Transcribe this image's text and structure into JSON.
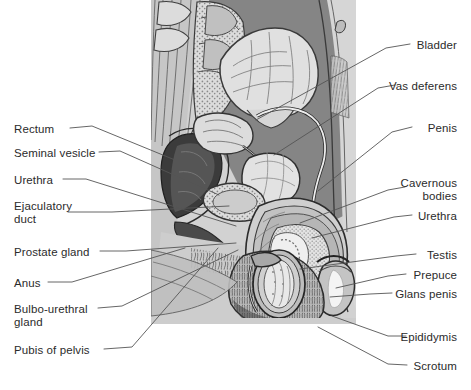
{
  "figure": {
    "background_color": "#ffffff",
    "text_color": "#2b2b2b",
    "leader_line_color": "#555555",
    "illustration": {
      "style": "grayscale medical line illustration",
      "palette": {
        "page": "#ffffff",
        "tissue_light": "#d8d8d8",
        "tissue_mid": "#bdbdbd",
        "tissue_dark": "#8f8f8f",
        "cavity_dark": "#7d7d7d",
        "organ_highlight": "#e8e8e8",
        "outline": "#3a3a3a",
        "deep_shadow": "#2e2e2e"
      }
    }
  },
  "labels": {
    "left": [
      {
        "id": "rectum",
        "text": "Rectum",
        "x": 14,
        "y": 123
      },
      {
        "id": "seminal-vesicle",
        "text": "Seminal vesicle",
        "x": 14,
        "y": 147
      },
      {
        "id": "urethra-left",
        "text": "Urethra",
        "x": 14,
        "y": 174
      },
      {
        "id": "ejaculatory-duct",
        "text": "Ejaculatory\nduct",
        "x": 14,
        "y": 200
      },
      {
        "id": "prostate-gland",
        "text": "Prostate gland",
        "x": 14,
        "y": 246
      },
      {
        "id": "anus",
        "text": "Anus",
        "x": 14,
        "y": 277
      },
      {
        "id": "bulbo-urethral",
        "text": "Bulbo-urethral\ngland",
        "x": 14,
        "y": 303
      },
      {
        "id": "pubis-of-pelvis",
        "text": "Pubis of pelvis",
        "x": 14,
        "y": 344
      }
    ],
    "right": [
      {
        "id": "bladder",
        "text": "Bladder",
        "x": 457,
        "y": 39
      },
      {
        "id": "vas-deferens",
        "text": "Vas deferens",
        "x": 457,
        "y": 80
      },
      {
        "id": "penis",
        "text": "Penis",
        "x": 457,
        "y": 122
      },
      {
        "id": "cavernous-bodies",
        "text": "Cavernous\nbodies",
        "x": 457,
        "y": 177
      },
      {
        "id": "urethra-right",
        "text": "Urethra",
        "x": 457,
        "y": 210
      },
      {
        "id": "testis",
        "text": "Testis",
        "x": 457,
        "y": 249
      },
      {
        "id": "prepuce",
        "text": "Prepuce",
        "x": 457,
        "y": 269
      },
      {
        "id": "glans-penis",
        "text": "Glans penis",
        "x": 457,
        "y": 288
      },
      {
        "id": "epididymis",
        "text": "Epididymis",
        "x": 457,
        "y": 331
      },
      {
        "id": "scrotum",
        "text": "Scrotum",
        "x": 457,
        "y": 360
      }
    ]
  },
  "leader_lines": [
    {
      "id": "leader-rectum",
      "points": "70,128 92,126 175,160"
    },
    {
      "id": "leader-seminal-vesicle",
      "points": "99,152 120,151 219,195"
    },
    {
      "id": "leader-urethra-left",
      "points": "63,179 86,179 236,226"
    },
    {
      "id": "leader-ejaculatory-duct",
      "points": "68,212 112,212 229,206"
    },
    {
      "id": "leader-prostate-gland",
      "points": "100,251 126,251 236,243"
    },
    {
      "id": "leader-anus",
      "points": "48,282 72,282 185,248"
    },
    {
      "id": "leader-bulbo-urethral",
      "points": "98,308 122,306 238,250"
    },
    {
      "id": "leader-pubis-of-pelvis",
      "points": "104,349 132,347 218,248"
    },
    {
      "id": "leader-bladder",
      "points": "410,44 386,48 256,120"
    },
    {
      "id": "leader-vas-deferens",
      "points": "395,85 378,88 274,155"
    },
    {
      "id": "leader-penis",
      "points": "412,127 392,132 318,191"
    },
    {
      "id": "leader-cavernous-bodies",
      "points": "405,187 388,190 300,223"
    },
    {
      "id": "leader-urethra-right",
      "points": "412,215 394,217 312,238"
    },
    {
      "id": "leader-testis",
      "points": "416,254 396,256 300,269"
    },
    {
      "id": "leader-prepuce",
      "points": "406,274 388,276 336,288"
    },
    {
      "id": "leader-glans-penis",
      "points": "392,293 370,294 330,297"
    },
    {
      "id": "leader-epididymis",
      "points": "406,336 388,336 332,316"
    },
    {
      "id": "leader-scrotum",
      "points": "407,365 388,364 318,327"
    }
  ]
}
